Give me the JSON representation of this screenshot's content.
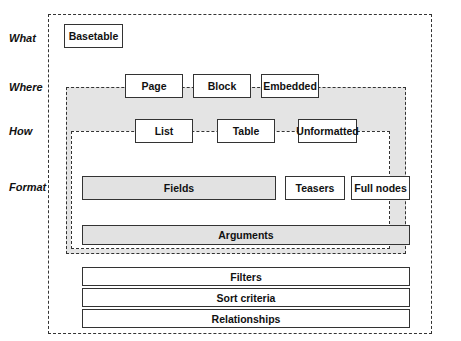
{
  "rows": {
    "what": "What",
    "where": "Where",
    "how": "How",
    "format": "Format"
  },
  "what": {
    "basetable": "Basetable"
  },
  "where": {
    "items": [
      "Page",
      "Block",
      "Embedded"
    ]
  },
  "how": {
    "items": [
      "List",
      "Table",
      "Unformatted"
    ]
  },
  "format": {
    "fields": "Fields",
    "teasers": "Teasers",
    "full_nodes": "Full nodes",
    "arguments": "Arguments"
  },
  "bottom": {
    "items": [
      "Filters",
      "Sort criteria",
      "Relationships"
    ]
  }
}
